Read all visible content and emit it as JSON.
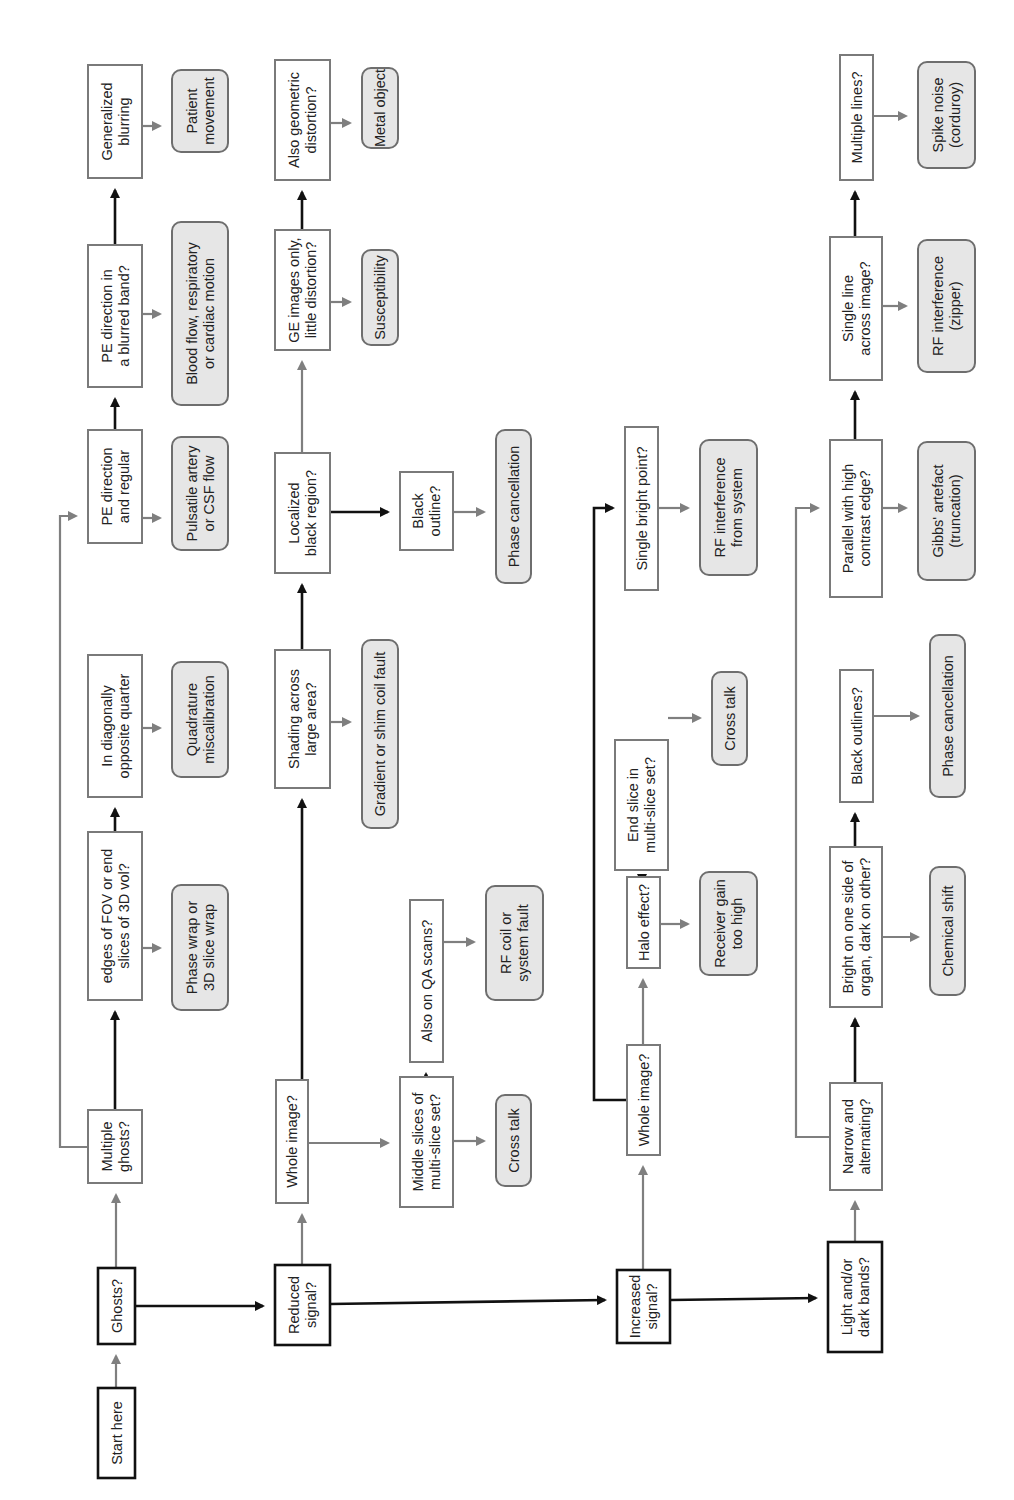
{
  "colors": {
    "black_path": "#111111",
    "grey_path": "#7f7f7f",
    "result_fill": "#e6e6e6",
    "question_border": "#7a7a7a"
  },
  "nodes": {
    "start": {
      "lines": [
        "Start here"
      ]
    },
    "ghosts": {
      "lines": [
        "Ghosts?"
      ]
    },
    "multiple_ghosts": {
      "lines": [
        "Multiple",
        "ghosts?"
      ]
    },
    "edges_fov": {
      "lines": [
        "edges of FOV or end",
        "slices of 3D vol?"
      ]
    },
    "diag_quarter": {
      "lines": [
        "In diagonally",
        "opposite quarter"
      ]
    },
    "pe_regular": {
      "lines": [
        "PE direction",
        "and regular"
      ]
    },
    "pe_blurred": {
      "lines": [
        "PE direction in",
        "a blurred band?"
      ]
    },
    "gen_blurring": {
      "lines": [
        "Generalized",
        "blurring"
      ]
    },
    "phase_wrap": {
      "lines": [
        "Phase wrap or",
        "3D slice wrap"
      ]
    },
    "quadrature": {
      "lines": [
        "Quadrature",
        "miscalibration"
      ]
    },
    "pulsatile": {
      "lines": [
        "Pulsatile artery",
        "or CSF flow"
      ]
    },
    "blood_flow": {
      "lines": [
        "Blood flow, respiratory",
        "or cardiac motion"
      ]
    },
    "patient_movement": {
      "lines": [
        "Patient",
        "movement"
      ]
    },
    "reduced_signal": {
      "lines": [
        "Reduced",
        "signal?"
      ]
    },
    "whole_image_r": {
      "lines": [
        "Whole image?"
      ]
    },
    "shading": {
      "lines": [
        "Shading  across",
        "large area?"
      ]
    },
    "localized_black": {
      "lines": [
        "Localized",
        "black region?"
      ]
    },
    "ge_images": {
      "lines": [
        "GE images only,",
        "little distortion?"
      ]
    },
    "geometric": {
      "lines": [
        "Also geometric",
        "distortion?"
      ]
    },
    "middle_slices": {
      "lines": [
        "Middle slices of",
        "multi-slice set?"
      ]
    },
    "qa_scans": {
      "lines": [
        "Also on QA scans?"
      ]
    },
    "black_outline": {
      "lines": [
        "Black",
        "outline?"
      ]
    },
    "cross_talk_1": {
      "lines": [
        "Cross talk"
      ]
    },
    "rf_coil": {
      "lines": [
        "RF coil or",
        "system fault"
      ]
    },
    "gradient_shim": {
      "lines": [
        "Gradient or shim coil fault"
      ]
    },
    "phase_cancel_1": {
      "lines": [
        "Phase cancellation"
      ]
    },
    "susceptibility": {
      "lines": [
        "Susceptibility"
      ]
    },
    "metal_object": {
      "lines": [
        "Metal object"
      ]
    },
    "increased_signal": {
      "lines": [
        "Increased",
        "signal?"
      ]
    },
    "whole_image_i": {
      "lines": [
        "Whole image?"
      ]
    },
    "halo": {
      "lines": [
        "Halo effect?"
      ]
    },
    "end_slice": {
      "lines": [
        "End slice in",
        "multi-slice set?"
      ]
    },
    "bright_point": {
      "lines": [
        "Single bright point?"
      ]
    },
    "receiver_gain": {
      "lines": [
        "Receiver gain",
        "too high"
      ]
    },
    "cross_talk_2": {
      "lines": [
        "Cross talk"
      ]
    },
    "rf_system": {
      "lines": [
        "RF interference",
        "from system"
      ]
    },
    "light_dark": {
      "lines": [
        "Light and/or",
        "dark bands?"
      ]
    },
    "narrow_alt": {
      "lines": [
        "Narrow and",
        "alternating?"
      ]
    },
    "bright_one_side": {
      "lines": [
        "Bright on one side of",
        "organ, dark on other?"
      ]
    },
    "black_outlines": {
      "lines": [
        "Black outlines?"
      ]
    },
    "parallel_edge": {
      "lines": [
        "Parallel with high",
        "contrast edge?"
      ]
    },
    "single_line": {
      "lines": [
        "Single line",
        "across image?"
      ]
    },
    "multiple_lines": {
      "lines": [
        "Multiple lines?"
      ]
    },
    "chemical_shift": {
      "lines": [
        "Chemical shift"
      ]
    },
    "phase_cancel_2": {
      "lines": [
        "Phase cancellation"
      ]
    },
    "gibbs": {
      "lines": [
        "Gibbs' artefact",
        "(truncation)"
      ]
    },
    "rf_zipper": {
      "lines": [
        "RF interference",
        "(zipper)"
      ]
    },
    "spike_noise": {
      "lines": [
        "Spike noise",
        "(corduroy)"
      ]
    }
  }
}
